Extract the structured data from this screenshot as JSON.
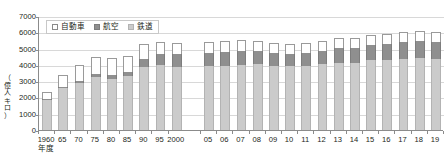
{
  "chart_data": {
    "type": "bar",
    "stacked": true,
    "title": "",
    "xlabel": "年度",
    "ylabel": "（億人キロ）",
    "ylim": [
      0,
      7000
    ],
    "ytick_step": 1000,
    "yticks": [
      "0",
      "1000",
      "2000",
      "3000",
      "4000",
      "5000",
      "6000",
      "7000"
    ],
    "grid": true,
    "legend_position": "top-left",
    "categories": [
      "1960",
      "65",
      "70",
      "75",
      "80",
      "85",
      "90",
      "95",
      "2000",
      "05",
      "06",
      "07",
      "08",
      "09",
      "10",
      "11",
      "12",
      "13",
      "14",
      "15",
      "16",
      "17",
      "18",
      "19"
    ],
    "series": [
      {
        "name": "鉄道",
        "color": "#cbcbcb",
        "values": [
          1843,
          2556,
          2887,
          3239,
          3143,
          3300,
          3873,
          4000,
          3848,
          3917,
          3952,
          4014,
          4042,
          3937,
          3934,
          3956,
          4047,
          4143,
          4140,
          4272,
          4327,
          4374,
          4419,
          4350
        ]
      },
      {
        "name": "航空",
        "color": "#8f8f8f",
        "values": [
          73,
          78,
          96,
          190,
          217,
          235,
          516,
          650,
          792,
          830,
          828,
          842,
          806,
          763,
          738,
          754,
          822,
          880,
          908,
          947,
          967,
          1003,
          1026,
          1040
        ]
      },
      {
        "name": "自動車",
        "color": "#ffffff",
        "values": [
          395,
          760,
          1010,
          1080,
          1055,
          1035,
          880,
          780,
          680,
          660,
          660,
          655,
          640,
          630,
          635,
          630,
          625,
          620,
          620,
          620,
          620,
          620,
          620,
          615
        ]
      }
    ],
    "totals": [
      2311,
      3394,
      3993,
      4509,
      4415,
      4570,
      5269,
      5430,
      5320,
      5407,
      5440,
      5511,
      5488,
      5330,
      5307,
      5340,
      5494,
      5643,
      5668,
      5839,
      5914,
      5997,
      6065,
      6005
    ]
  },
  "legend": {
    "items": [
      {
        "label": "自動車",
        "swatch": "legend-swatch-auto"
      },
      {
        "label": "航空",
        "swatch": "legend-swatch-air"
      },
      {
        "label": "鉄道",
        "swatch": "legend-swatch-rail"
      }
    ]
  },
  "axis": {
    "y_label_text": "（\n億\n人\n キ\nロ\n）",
    "x_unit": "年度"
  }
}
